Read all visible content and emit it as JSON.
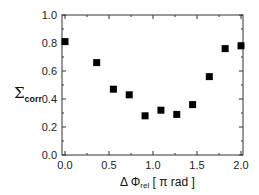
{
  "chart_data": {
    "type": "scatter",
    "title": "",
    "xlabel": "Δ Φrel [ π rad ]",
    "ylabel": "Σcorr",
    "xlim": [
      0.0,
      2.0
    ],
    "ylim": [
      0.0,
      1.0
    ],
    "xticks": [
      "0.0",
      "0.5",
      "1.0",
      "1.5",
      "2.0"
    ],
    "yticks": [
      "0.0",
      "0.2",
      "0.4",
      "0.6",
      "0.8",
      "1.0"
    ],
    "grid": false,
    "legend": null,
    "marker": "filled-square",
    "series": [
      {
        "name": "Σcorr",
        "x": [
          0.0,
          0.36,
          0.55,
          0.73,
          0.91,
          1.09,
          1.27,
          1.45,
          1.64,
          1.82,
          2.0
        ],
        "y": [
          0.81,
          0.66,
          0.47,
          0.43,
          0.28,
          0.32,
          0.29,
          0.36,
          0.56,
          0.76,
          0.78
        ]
      }
    ]
  },
  "labels": {
    "y_main": "Σ",
    "y_sub": "corr",
    "x_main": "Δ Φ",
    "x_sub": "rel",
    "x_unit": " [ π rad ]"
  }
}
